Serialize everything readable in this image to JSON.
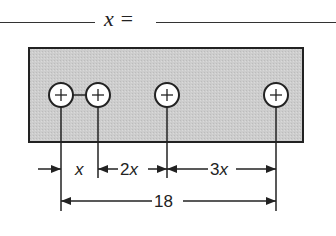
{
  "header": {
    "answer_prompt": "x ="
  },
  "diagram": {
    "plate": {
      "fill": "#cfcfcf",
      "stroke": "#222222"
    },
    "holes_count": 4,
    "dimensions": {
      "first_gap": "x",
      "second_gap": "2x",
      "third_gap": "3x",
      "total": "18"
    }
  }
}
